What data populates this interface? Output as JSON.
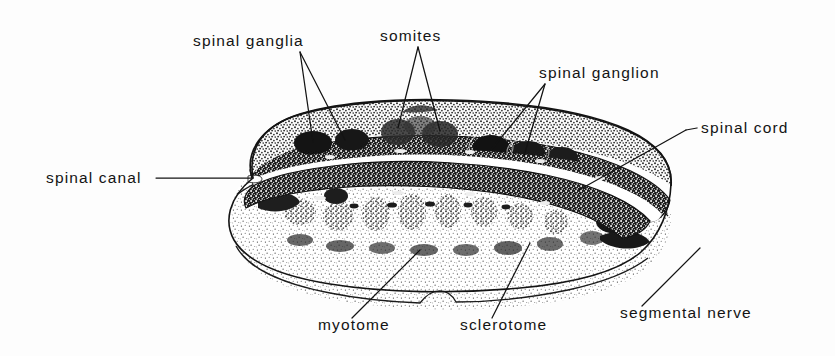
{
  "figure": {
    "kind": "anatomical-line-drawing",
    "background_color": "#fdfdfd",
    "ink_color": "#141414"
  },
  "labels": {
    "spinal_ganglia": "spinal ganglia",
    "somites": "somites",
    "spinal_ganglion": "spinal ganglion",
    "spinal_cord": "spinal cord",
    "spinal_canal": "spinal canal",
    "myotome": "myotome",
    "sclerotome": "sclerotome",
    "segmental_nerve": "segmental nerve"
  },
  "label_positions": {
    "spinal_ganglia": {
      "x": 193,
      "y": 46,
      "anchor": "start"
    },
    "somites": {
      "x": 380,
      "y": 41,
      "anchor": "start"
    },
    "spinal_ganglion": {
      "x": 539,
      "y": 78,
      "anchor": "start"
    },
    "spinal_cord": {
      "x": 700,
      "y": 133,
      "anchor": "start"
    },
    "spinal_canal": {
      "x": 46,
      "y": 183,
      "anchor": "start"
    },
    "myotome": {
      "x": 318,
      "y": 330,
      "anchor": "start"
    },
    "sclerotome": {
      "x": 460,
      "y": 330,
      "anchor": "start"
    },
    "segmental_nerve": {
      "x": 620,
      "y": 318,
      "anchor": "start"
    }
  },
  "leaders": {
    "spinal_ganglia": [
      [
        [
          300,
          52
        ],
        [
          313,
          142
        ]
      ],
      [
        [
          300,
          52
        ],
        [
          345,
          140
        ]
      ]
    ],
    "somites": [
      [
        [
          418,
          47
        ],
        [
          398,
          128
        ]
      ],
      [
        [
          418,
          47
        ],
        [
          440,
          131
        ]
      ]
    ],
    "spinal_ganglion": [
      [
        [
          545,
          84
        ],
        [
          491,
          150
        ]
      ],
      [
        [
          545,
          84
        ],
        [
          524,
          156
        ]
      ]
    ],
    "spinal_cord": [
      [
        [
          694,
          128
        ],
        [
          684,
          130
        ]
      ],
      [
        [
          684,
          130
        ],
        [
          579,
          190
        ]
      ]
    ],
    "spinal_canal": [
      [
        [
          156,
          178
        ],
        [
          253,
          178
        ]
      ]
    ],
    "myotome": [
      [
        [
          352,
          318
        ],
        [
          420,
          250
        ]
      ]
    ],
    "sclerotome": [
      [
        [
          492,
          318
        ],
        [
          530,
          243
        ]
      ]
    ],
    "segmental_nerve": [
      [
        [
          642,
          306
        ],
        [
          700,
          248
        ]
      ]
    ]
  },
  "regions": {
    "dorsal_band": "stippled dorsal mass containing spinal ganglia",
    "spinal_cord_band": "dense dark stippled neural tube wall",
    "spinal_canal": "white central cleft",
    "ventral_mass": "light stippled sclerotome and myotome with segmental blocks"
  }
}
